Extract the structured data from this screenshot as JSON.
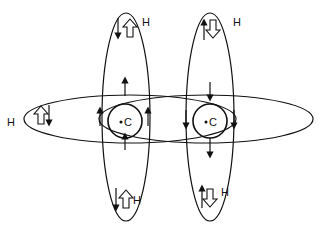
{
  "diagram": {
    "carbons": [
      {
        "label": "C",
        "cx": 125,
        "cy": 121
      },
      {
        "label": "C",
        "cx": 210,
        "cy": 121
      }
    ],
    "hydrogens": [
      {
        "label": "H",
        "x": 142,
        "y": 22
      },
      {
        "label": "H",
        "x": 233,
        "y": 22
      },
      {
        "label": "H",
        "x": 7,
        "y": 123
      },
      {
        "label": "H",
        "x": 134,
        "y": 201
      },
      {
        "label": "H",
        "x": 222,
        "y": 193
      }
    ],
    "colors": {
      "stroke": "#111111",
      "background": "#ffffff"
    }
  }
}
